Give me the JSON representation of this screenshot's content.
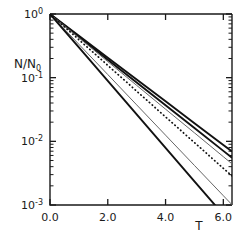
{
  "chart_data": {
    "type": "line",
    "title": "",
    "xlabel": "T",
    "ylabel": "N/N0",
    "ylabel_display": "N/N₀",
    "yscale": "log",
    "xscale": "linear",
    "xlim": [
      0.0,
      6.3
    ],
    "ylim": [
      0.001,
      1.0
    ],
    "grid": false,
    "legend": "none",
    "xticks": [
      0.0,
      2.0,
      4.0,
      6.0
    ],
    "xtick_labels": [
      "0.0",
      "2.0",
      "4.0",
      "6.0"
    ],
    "yticks": [
      1,
      0.1,
      0.01,
      0.001
    ],
    "ytick_labels": [
      "10⁰",
      "10⁻¹",
      "10⁻²",
      "10⁻³"
    ],
    "ytick_mantissas": [
      "10",
      "10",
      "10",
      "10"
    ],
    "ytick_exponents": [
      "0",
      "-1",
      "-2",
      "-3"
    ],
    "minor_ticks": "log-decade",
    "x": [
      0.0,
      1.0,
      2.0,
      3.0,
      4.0,
      5.0,
      6.0,
      6.3
    ],
    "series": [
      {
        "name": "curve-1-solid-thick-upper",
        "style": "solid",
        "color": "#111111",
        "width": 1.9,
        "decay_rate": 0.79,
        "values": [
          1.0,
          0.454,
          0.206,
          0.0935,
          0.0425,
          0.0193,
          0.00876,
          0.00691
        ]
      },
      {
        "name": "curve-2-solid-thick-lower",
        "style": "solid",
        "color": "#111111",
        "width": 1.9,
        "decay_rate": 0.825,
        "values": [
          1.0,
          0.438,
          0.192,
          0.0841,
          0.0368,
          0.0162,
          0.00708,
          0.00553
        ]
      },
      {
        "name": "curve-3-solid-thin-gray",
        "style": "solid",
        "color": "#666666",
        "width": 1.0,
        "decay_rate": 0.86,
        "values": [
          1.0,
          0.423,
          0.179,
          0.0757,
          0.032,
          0.0136,
          0.00574,
          0.00443
        ]
      },
      {
        "name": "curve-4-dotted",
        "style": "dotted",
        "color": "#111111",
        "width": 1.7,
        "decay_rate": 0.93,
        "values": [
          1.0,
          0.395,
          0.156,
          0.0614,
          0.0242,
          0.00956,
          0.00377,
          0.00286
        ]
      },
      {
        "name": "curve-5-solid-thin-gray",
        "style": "solid",
        "color": "#666666",
        "width": 1.0,
        "decay_rate": 1.095,
        "values": [
          1.0,
          0.334,
          0.112,
          0.0374,
          0.0125,
          0.00418,
          0.0014,
          0.00101
        ]
      },
      {
        "name": "curve-6-solid-thick-steepest",
        "style": "solid",
        "color": "#111111",
        "width": 1.9,
        "decay_rate": 1.21,
        "values": [
          1.0,
          0.298,
          0.0889,
          0.0265,
          0.0079,
          0.00236,
          0.000703,
          0.000489
        ]
      }
    ]
  },
  "axes": {
    "x_axis_label": "T",
    "y_axis_label_numerator": "N",
    "y_axis_label_slash": "/",
    "y_axis_label_denominator": "N",
    "y_axis_label_subscript": "0"
  },
  "colors": {
    "background": "#ffffff",
    "axis": "#1a1a1a",
    "primary_line": "#111111",
    "secondary_line": "#666666"
  }
}
